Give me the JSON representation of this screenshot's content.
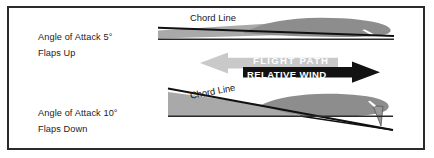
{
  "figure": {
    "background_color": "#ffffff",
    "border_color": "#2b2b2b"
  },
  "colors": {
    "airfoil_fill": "#8f8f8f",
    "airfoil_light_fill": "#a8a8a8",
    "chord_line": "#111111",
    "flight_path_arrow": "#c9c9c9",
    "relative_wind_arrow": "#111111",
    "caption_text": "#ffffff",
    "label_text": "#1c1c1c"
  },
  "top_case": {
    "angle_of_attack_label": "Angle of Attack 5°",
    "flaps_label": "Flaps Up",
    "chord_line_label": "Chord Line",
    "angle_of_attack_degrees": 5,
    "flaps": "up"
  },
  "bottom_case": {
    "angle_of_attack_label": "Angle of Attack 10°",
    "flaps_label": "Flaps Down",
    "chord_line_label": "Chord Line",
    "angle_of_attack_degrees": 10,
    "flaps": "down"
  },
  "arrows": {
    "flight_path": {
      "label": "FLIGHT  PATH",
      "direction": "left",
      "color": "#c9c9c9"
    },
    "relative_wind": {
      "label": "RELATIVE WIND",
      "direction": "right",
      "color": "#111111"
    }
  }
}
